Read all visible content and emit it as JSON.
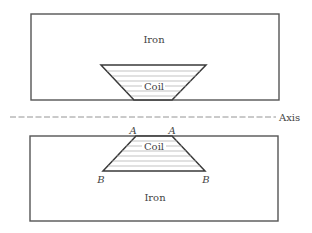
{
  "diagram": {
    "upper_region": {
      "material_label": "Iron",
      "coil_label": "Coil"
    },
    "axis": {
      "label": "Axis"
    },
    "lower_region": {
      "material_label": "Iron",
      "coil_label": "Coil",
      "corner_labels": {
        "top_left": "A",
        "top_right": "A",
        "bottom_left": "B",
        "bottom_right": "B"
      }
    },
    "colors": {
      "line": "#555555",
      "text": "#444444",
      "hatch": "#aaaaaa",
      "background": "#ffffff"
    }
  }
}
